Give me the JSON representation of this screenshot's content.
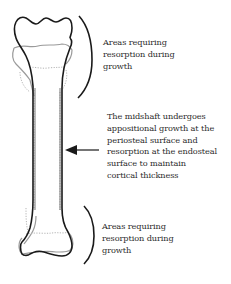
{
  "diagram": {
    "labels": {
      "top": {
        "lines": [
          "Areas requiring",
          "resorption during",
          "growth"
        ]
      },
      "middle": {
        "lines": [
          "The midshaft undergoes",
          "appositional growth at the",
          "periosteal surface and",
          "resorption at the endosteal",
          "surface to maintain",
          "cortical thickness"
        ]
      },
      "bottom": {
        "lines": [
          "Areas requiring",
          "resorption during",
          "growth"
        ]
      }
    },
    "icons": {
      "top_bracket": "right-parenthesis-bracket",
      "bottom_bracket": "right-parenthesis-bracket",
      "arrow": "left-arrow"
    },
    "colors": {
      "mature_outline": "#1a1a1a",
      "immature_outline": "#9a9a9a",
      "dotted_outline": "#b5b5b5",
      "text": "#2b2b2b"
    }
  }
}
